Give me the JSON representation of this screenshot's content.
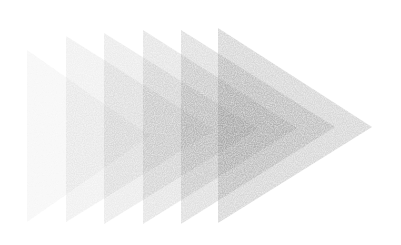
{
  "illustration": {
    "subject": "overlapping-triangles-pointing-right",
    "background": "#ffffff",
    "fill_color": "#6e6e6e",
    "triangles": [
      {
        "left": 27,
        "top": 50,
        "bottom": 222,
        "apex_x": 150,
        "apex_y": 136,
        "opacity": 0.06
      },
      {
        "left": 66,
        "top": 36,
        "bottom": 222,
        "apex_x": 215,
        "apex_y": 130,
        "opacity": 0.1
      },
      {
        "left": 104,
        "top": 33,
        "bottom": 224,
        "apex_x": 258,
        "apex_y": 129,
        "opacity": 0.14
      },
      {
        "left": 143,
        "top": 30,
        "bottom": 224,
        "apex_x": 297,
        "apex_y": 128,
        "opacity": 0.18
      },
      {
        "left": 181,
        "top": 30,
        "bottom": 224,
        "apex_x": 335,
        "apex_y": 127,
        "opacity": 0.22
      },
      {
        "left": 218,
        "top": 28,
        "bottom": 223,
        "apex_x": 372,
        "apex_y": 127,
        "opacity": 0.28
      }
    ]
  }
}
